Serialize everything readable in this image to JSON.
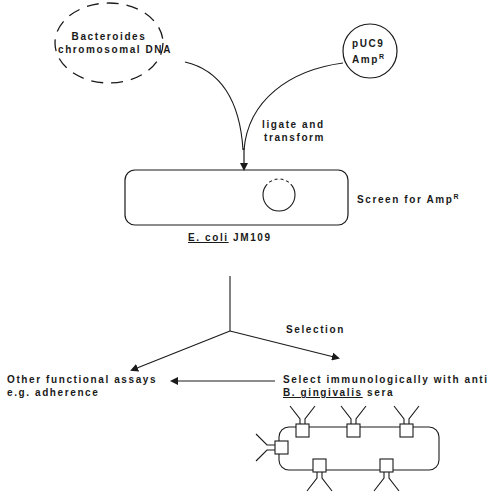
{
  "diagram": {
    "nodes": {
      "bacteroides_dna": {
        "line1": "Bacteroides",
        "line2": "chromosomal DNA"
      },
      "puc9": {
        "line1": "pUC9",
        "line2_base": "Amp",
        "line2_sup": "R"
      },
      "ecoli": {
        "species": "E. coli",
        "strain": " JM109"
      },
      "screen": {
        "text": "Screen for Amp",
        "sup": "R"
      },
      "other_assays": {
        "line1": "Other functional assays",
        "line2": "e.g. adherence"
      },
      "select_immuno": {
        "line1": "Select immunologically with anti",
        "line2_species": "B. gingivalis",
        "line2_rest": " sera"
      }
    },
    "edge_labels": {
      "ligate": {
        "line1": "ligate and",
        "line2": "transform"
      },
      "selection": "Selection"
    },
    "colors": {
      "stroke": "#1a1a1a",
      "background": "#ffffff"
    }
  }
}
